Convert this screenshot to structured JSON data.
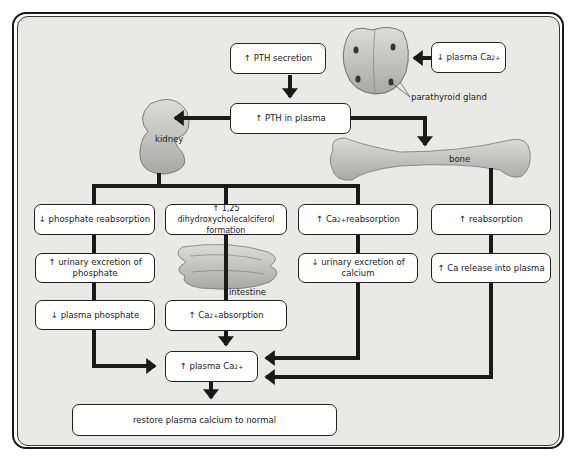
{
  "diagram": {
    "nodes": {
      "pth_secretion": {
        "arrow": "↑",
        "text": "PTH secretion"
      },
      "plasma_ca_low": {
        "arrow": "↓",
        "text": "plasma Ca",
        "sup": "2+"
      },
      "pth_plasma": {
        "arrow": "↑",
        "text": "PTH in plasma"
      },
      "phosphate_reabs": {
        "arrow": "↓",
        "text": "phosphate reabsorption"
      },
      "dihydroxy": {
        "arrow": "↑",
        "text": "1,25 dihydroxycholecalciferol formation"
      },
      "ca_reabs": {
        "arrow": "↑",
        "text": "Ca",
        "sup": "2+",
        "text2": " reabsorption"
      },
      "bone_reabs": {
        "arrow": "↑",
        "text": "reabsorption"
      },
      "urinary_phosphate": {
        "arrow": "↑",
        "text": "urinary excretion of phosphate"
      },
      "urinary_calcium": {
        "arrow": "↓",
        "text": "urinary excretion of calcium"
      },
      "ca_release": {
        "arrow": "↑",
        "text": "Ca release into plasma"
      },
      "plasma_phosphate": {
        "arrow": "↓",
        "text": "plasma phosphate"
      },
      "ca_absorption": {
        "arrow": "↑",
        "text": "Ca",
        "sup": "2+",
        "text2": " absorption"
      },
      "plasma_ca_high": {
        "arrow": "↑",
        "text": "plasma Ca",
        "sup": "2+"
      },
      "restore": {
        "text": "restore plasma calcium to normal"
      }
    },
    "labels": {
      "kidney": "kidney",
      "bone": "bone",
      "intestine": "intestine",
      "parathyroid": "parathyroid gland"
    },
    "colors": {
      "panel": "#e9e9e6",
      "box": "#ffffff",
      "arrow": "#1a1a1a",
      "organ": "#c8c8c4"
    }
  }
}
